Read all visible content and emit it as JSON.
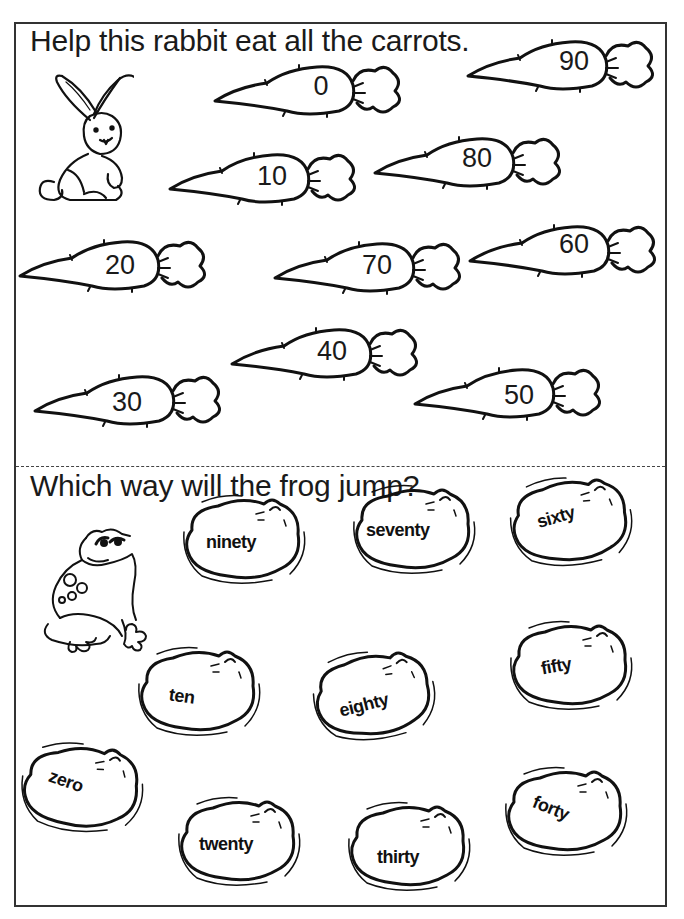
{
  "worksheet": {
    "rabbit_section": {
      "instruction": "Help this rabbit eat all the carrots.",
      "character": "rabbit-icon",
      "carrots": [
        {
          "label": "0",
          "x": 205,
          "y": 55
        },
        {
          "label": "90",
          "x": 458,
          "y": 30
        },
        {
          "label": "10",
          "x": 160,
          "y": 143
        },
        {
          "label": "80",
          "x": 365,
          "y": 127
        },
        {
          "label": "20",
          "x": 10,
          "y": 230
        },
        {
          "label": "70",
          "x": 265,
          "y": 232
        },
        {
          "label": "60",
          "x": 460,
          "y": 215
        },
        {
          "label": "40",
          "x": 222,
          "y": 318
        },
        {
          "label": "30",
          "x": 25,
          "y": 365
        },
        {
          "label": "50",
          "x": 405,
          "y": 358
        }
      ]
    },
    "frog_section": {
      "instruction": "Which way will the frog jump?",
      "character": "frog-icon",
      "lily_pads": [
        {
          "label": "ninety",
          "x": 170,
          "y": 488,
          "rot": 0,
          "tx": 34,
          "ty": 42
        },
        {
          "label": "seventy",
          "x": 340,
          "y": 478,
          "rot": 0,
          "tx": 24,
          "ty": 40
        },
        {
          "label": "sixty",
          "x": 497,
          "y": 470,
          "rot": -12,
          "tx": 38,
          "ty": 38
        },
        {
          "label": "ten",
          "x": 125,
          "y": 640,
          "rot": 8,
          "tx": 44,
          "ty": 48
        },
        {
          "label": "eighty",
          "x": 300,
          "y": 645,
          "rot": -8,
          "tx": 38,
          "ty": 52
        },
        {
          "label": "fifty",
          "x": 497,
          "y": 615,
          "rot": -10,
          "tx": 44,
          "ty": 44
        },
        {
          "label": "zero",
          "x": 5,
          "y": 735,
          "rot": 15,
          "tx": 38,
          "ty": 34
        },
        {
          "label": "twenty",
          "x": 165,
          "y": 790,
          "rot": 0,
          "tx": 32,
          "ty": 42
        },
        {
          "label": "thirty",
          "x": 335,
          "y": 795,
          "rot": 0,
          "tx": 40,
          "ty": 50
        },
        {
          "label": "forty",
          "x": 492,
          "y": 760,
          "rot": 22,
          "tx": 38,
          "ty": 36
        }
      ]
    }
  }
}
